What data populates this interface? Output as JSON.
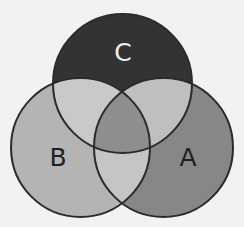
{
  "diagram": {
    "type": "venn-3",
    "background": "#f2f2f2",
    "stroke_color": "#2b2b2b",
    "sets": [
      {
        "id": "A",
        "label": "A",
        "cx": 163.5,
        "cy": 147.5,
        "r": 69.5,
        "fill": "#878787",
        "label_color": "#1f1f1f",
        "label_x": 188,
        "label_y": 157
      },
      {
        "id": "B",
        "label": "B",
        "cx": 80.5,
        "cy": 147.5,
        "r": 69.5,
        "fill": "#b4b4b4",
        "label_color": "#1f1f1f",
        "label_x": 58,
        "label_y": 157
      },
      {
        "id": "C",
        "label": "C",
        "cx": 122.5,
        "cy": 83.5,
        "r": 69.5,
        "fill": "#333333",
        "label_color": "#f0f0f0",
        "label_x": 123,
        "label_y": 52
      }
    ],
    "intersections": {
      "B_C": "#c9c9c9",
      "A_C": "#bfbfbf",
      "A_B": "#c5c5c5",
      "A_B_C": "#8e8e8e"
    }
  }
}
